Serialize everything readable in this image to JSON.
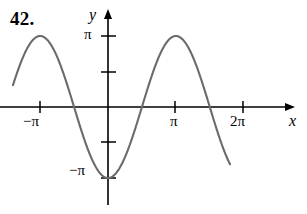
{
  "exercise": {
    "number": "42."
  },
  "axes": {
    "x_label": "x",
    "y_label": "y",
    "x_tick_labels": [
      "−π",
      "π",
      "2π"
    ],
    "y_tick_labels": [
      "π",
      "−π"
    ],
    "axis_color": "#000000"
  },
  "chart_data": {
    "type": "line",
    "title": "",
    "subtitle": "",
    "xlabel": "x",
    "ylabel": "y",
    "xlim": [
      -4.4,
      5.65
    ],
    "ylim": [
      -4.6,
      4.6
    ],
    "grid": false,
    "legend": null,
    "annotations": [],
    "x_ticks": [
      -3.14159,
      3.14159,
      6.28319
    ],
    "x_tick_labels": [
      "−π",
      "π",
      "2π"
    ],
    "y_ticks": [
      3.14159,
      1.5708,
      -1.5708,
      -3.14159
    ],
    "y_tick_labels": [
      "π",
      "",
      "",
      "−π"
    ],
    "series": [
      {
        "name": "y = −π cos x",
        "color": "#6b6b6b",
        "amplitude": 3.14159,
        "period": 6.28319,
        "formula": "y = -pi*cos(x)",
        "x": [
          -4.4,
          -4.0,
          -3.6,
          -3.14159,
          -2.8,
          -2.4,
          -2.0,
          -1.5708,
          -1.2,
          -0.8,
          -0.4,
          0.0,
          0.4,
          0.8,
          1.2,
          1.5708,
          2.0,
          2.4,
          2.8,
          3.14159,
          3.6,
          4.0,
          4.4,
          4.71239,
          5.0,
          5.4,
          5.65
        ],
        "y": [
          -0.94,
          2.05,
          2.83,
          3.14,
          2.96,
          2.32,
          1.31,
          0.0,
          -1.14,
          -2.19,
          -2.89,
          -3.14,
          -2.89,
          -2.19,
          -1.14,
          0.0,
          1.31,
          2.32,
          2.96,
          3.14,
          2.83,
          2.05,
          0.94,
          0.0,
          -0.89,
          -2.0,
          -2.62
        ],
        "key_points": {
          "maxima_x": [
            -3.14159,
            3.14159
          ],
          "maxima_y": 3.14159,
          "minima_x": [
            0.0,
            6.28319
          ],
          "minima_y": -3.14159,
          "zeros_x": [
            -1.5708,
            1.5708,
            4.71239,
            7.85398
          ]
        }
      }
    ]
  },
  "geometry": {
    "note": "pixel layout reference",
    "origin_px": [
      108,
      107
    ],
    "x_unit_px": 21.6,
    "y_unit_px": 22.6
  }
}
